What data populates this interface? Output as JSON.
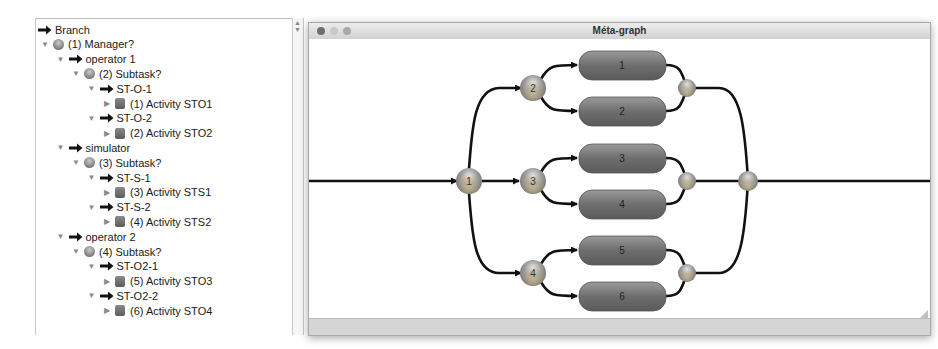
{
  "tree": {
    "items": [
      {
        "label": "Branch",
        "icon": "arrow-icon",
        "depth": 0,
        "disclosure": "none"
      },
      {
        "label": "(1) Manager?",
        "icon": "ball-icon",
        "depth": 0,
        "disclosure": "expanded"
      },
      {
        "label": "operator 1",
        "icon": "arrow-icon",
        "depth": 1,
        "disclosure": "expanded"
      },
      {
        "label": "(2) Subtask?",
        "icon": "ball-icon",
        "depth": 2,
        "disclosure": "expanded"
      },
      {
        "label": "ST-O-1",
        "icon": "arrow-icon",
        "depth": 3,
        "disclosure": "expanded"
      },
      {
        "label": "(1) Activity STO1",
        "icon": "box-icon",
        "depth": 4,
        "disclosure": "collapsed"
      },
      {
        "label": "ST-O-2",
        "icon": "arrow-icon",
        "depth": 3,
        "disclosure": "expanded"
      },
      {
        "label": "(2) Activity STO2",
        "icon": "box-icon",
        "depth": 4,
        "disclosure": "collapsed"
      },
      {
        "label": "simulator",
        "icon": "arrow-icon",
        "depth": 1,
        "disclosure": "expanded"
      },
      {
        "label": "(3) Subtask?",
        "icon": "ball-icon",
        "depth": 2,
        "disclosure": "expanded"
      },
      {
        "label": "ST-S-1",
        "icon": "arrow-icon",
        "depth": 3,
        "disclosure": "expanded"
      },
      {
        "label": "(3) Activity STS1",
        "icon": "box-icon",
        "depth": 4,
        "disclosure": "collapsed"
      },
      {
        "label": "ST-S-2",
        "icon": "arrow-icon",
        "depth": 3,
        "disclosure": "expanded"
      },
      {
        "label": "(4) Activity STS2",
        "icon": "box-icon",
        "depth": 4,
        "disclosure": "collapsed"
      },
      {
        "label": "operator 2",
        "icon": "arrow-icon",
        "depth": 1,
        "disclosure": "expanded"
      },
      {
        "label": "(4) Subtask?",
        "icon": "ball-icon",
        "depth": 2,
        "disclosure": "expanded"
      },
      {
        "label": "ST-O2-1",
        "icon": "arrow-icon",
        "depth": 3,
        "disclosure": "expanded"
      },
      {
        "label": "(5) Activity STO3",
        "icon": "box-icon",
        "depth": 4,
        "disclosure": "collapsed"
      },
      {
        "label": "ST-O2-2",
        "icon": "arrow-icon",
        "depth": 3,
        "disclosure": "expanded"
      },
      {
        "label": "(6) Activity STO4",
        "icon": "box-icon",
        "depth": 4,
        "disclosure": "collapsed"
      }
    ]
  },
  "window": {
    "title": "Méta-graph",
    "traffic_lights": [
      "close",
      "minimize",
      "zoom"
    ],
    "traffic_colors": [
      "#6e6e6e",
      "#c9c9c9",
      "#a9a9a9"
    ]
  },
  "graph": {
    "decision_nodes": [
      {
        "id": "1",
        "label": "1"
      },
      {
        "id": "2",
        "label": "2"
      },
      {
        "id": "3",
        "label": "3"
      },
      {
        "id": "4",
        "label": "4"
      }
    ],
    "activity_nodes": [
      {
        "id": "a1",
        "label": "1"
      },
      {
        "id": "a2",
        "label": "2"
      },
      {
        "id": "a3",
        "label": "3"
      },
      {
        "id": "a4",
        "label": "4"
      },
      {
        "id": "a5",
        "label": "5"
      },
      {
        "id": "a6",
        "label": "6"
      }
    ],
    "colors": {
      "edge": "#111111",
      "node": "#8c8c8c",
      "activity": "#6f6f6f"
    }
  }
}
